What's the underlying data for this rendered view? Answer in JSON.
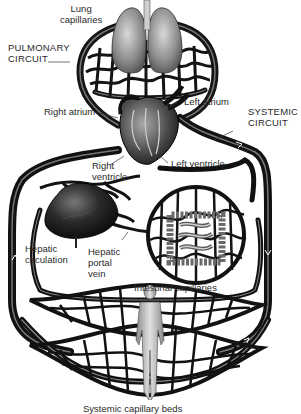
{
  "diagram": {
    "colors": {
      "vessel": "#1a1a1a",
      "vessel_highlight": "#8a8a8a",
      "organ_gray": "#6e6e6e",
      "organ_light": "#bdbdbd",
      "background": "#ffffff",
      "label_text": "#2a2a2a"
    },
    "labels": {
      "lung_capillaries": [
        "Lung",
        "capillaries"
      ],
      "pulmonary_circuit": [
        "PULMONARY",
        "CIRCUIT"
      ],
      "right_atrium": "Right atrium",
      "left_atrium": "Left atrium",
      "systemic_circuit": [
        "SYSTEMIC",
        "CIRCUIT"
      ],
      "right_ventricle": [
        "Right",
        "ventricle"
      ],
      "left_ventricle": "Left ventricle",
      "hepatic_circulation": [
        "Hepatic",
        "circulation"
      ],
      "hepatic_portal_vein": [
        "Hepatic",
        "portal",
        "vein"
      ],
      "intestinal_capillaries": "Intestinal capillaries",
      "systemic_capillary_beds": "Systemic capillary beds"
    },
    "structures": [
      {
        "name": "lungs",
        "icon": "lung-icon"
      },
      {
        "name": "heart",
        "icon": "heart-icon"
      },
      {
        "name": "liver",
        "icon": "liver-icon"
      },
      {
        "name": "intestines",
        "icon": "intestine-icon"
      },
      {
        "name": "human figure",
        "icon": "human-figure-icon"
      }
    ]
  }
}
